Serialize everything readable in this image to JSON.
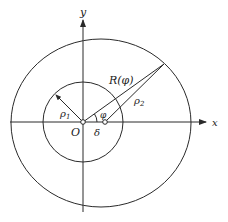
{
  "diagram": {
    "axes": {
      "x_label": "x",
      "y_label": "y",
      "origin_label": "O"
    },
    "labels": {
      "rho1": "ρ",
      "rho1_sub": "1",
      "rho2": "ρ",
      "rho2_sub": "2",
      "R_phi": "R(φ)",
      "phi": "φ",
      "delta": "δ"
    },
    "colors": {
      "line": "#2a2a2a",
      "background": "#ffffff"
    },
    "elements": [
      {
        "type": "circle",
        "name": "inner-circle",
        "center": "O",
        "radius_label": "ρ1"
      },
      {
        "type": "circle",
        "name": "outer-circle",
        "center": "offset by δ",
        "radius_label": "ρ2"
      },
      {
        "type": "segment",
        "name": "R-phi-segment",
        "from": "O",
        "label": "R(φ)"
      },
      {
        "type": "segment",
        "name": "rho2-segment",
        "from": "offset center",
        "label": "ρ2"
      },
      {
        "type": "angle",
        "name": "phi-angle",
        "label": "φ"
      },
      {
        "type": "segment",
        "name": "delta-offset",
        "label": "δ"
      }
    ]
  }
}
